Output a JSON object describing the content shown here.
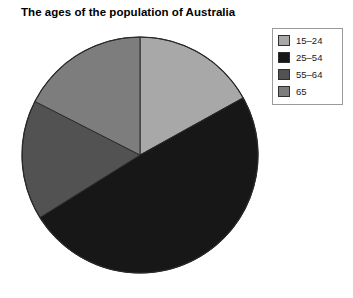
{
  "chart_data": {
    "type": "pie",
    "title": "The ages of the population of Australia",
    "xlabel": "",
    "ylabel": "",
    "categories": [
      "15–24",
      "25–54",
      "55–64",
      "65"
    ],
    "values": [
      17,
      49,
      16,
      18
    ],
    "unit": "percent",
    "start_angle_deg": 0,
    "direction": "clockwise",
    "slice_angles_deg": [
      61,
      177,
      59,
      63
    ],
    "slice_boundaries_deg": [
      0,
      61,
      238,
      297,
      360
    ],
    "colors": [
      "#a8a8a8",
      "#171717",
      "#525252",
      "#7d7d7d"
    ],
    "grid": false,
    "legend_position": "top-right",
    "series": [
      {
        "name": "Population share",
        "values": [
          17,
          49,
          16,
          18
        ]
      }
    ],
    "geometry": {
      "center_x": 140,
      "center_y": 155,
      "radius": 118,
      "outline_color": "#2a2a2a"
    }
  },
  "legend": {
    "items": [
      {
        "label": "15–24",
        "color": "#a8a8a8"
      },
      {
        "label": "25–54",
        "color": "#171717"
      },
      {
        "label": "55–64",
        "color": "#525252"
      },
      {
        "label": "65",
        "color": "#7d7d7d"
      }
    ]
  }
}
